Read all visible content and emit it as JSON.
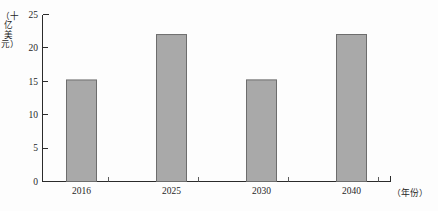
{
  "chart_data": {
    "type": "bar",
    "title": "",
    "subtitle": "",
    "categories": [
      "2016",
      "2025",
      "2030",
      "2040"
    ],
    "values": [
      7.0,
      12.2,
      15.2,
      22.0
    ],
    "series": [
      {
        "name": "",
        "values": [
          7.0,
          12.2,
          15.2,
          22.0
        ]
      }
    ],
    "xlabel": "（年份）",
    "ylabel": "（十亿美元）",
    "ylim": [
      0,
      25
    ],
    "yticks": [
      "0",
      "5",
      "10",
      "15",
      "20",
      "25"
    ],
    "ytick_values": [
      0,
      5,
      10,
      15,
      20,
      25
    ],
    "grid": false,
    "legend": false,
    "legend_position": "none",
    "bar_fill_color": "#a9a9a9",
    "bar_border_color": "#6d6d6d",
    "axis_color": "#2b2b2b",
    "annotations": []
  },
  "axis": {
    "y_title_chars": [
      "（",
      "十",
      "亿",
      "美",
      "元",
      "）"
    ],
    "x_title": "（年份）"
  }
}
